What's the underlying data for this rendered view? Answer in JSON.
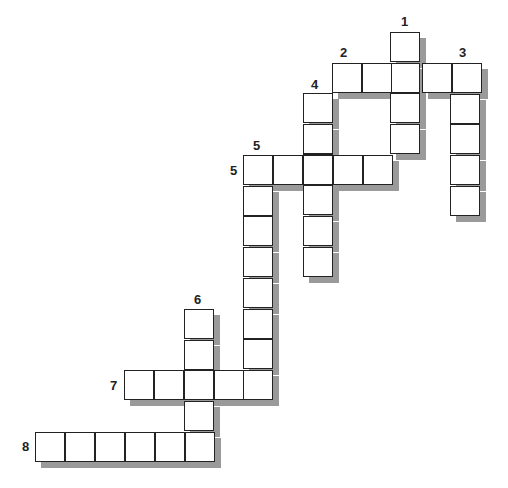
{
  "puzzle": {
    "type": "crossword",
    "cell_size": 30,
    "words": [
      {
        "number": "1",
        "direction": "down",
        "length": 4,
        "start_x": 390,
        "start_y": 32,
        "label_x": 401,
        "label_y": 15
      },
      {
        "number": "2",
        "direction": "across",
        "length": 5,
        "start_x": 332,
        "start_y": 63,
        "label_x": 340,
        "label_y": 46
      },
      {
        "number": "3",
        "direction": "down",
        "length": 5,
        "start_x": 450,
        "start_y": 63,
        "label_x": 459,
        "label_y": 46
      },
      {
        "number": "4",
        "direction": "down",
        "length": 6,
        "start_x": 303,
        "start_y": 93,
        "label_x": 311,
        "label_y": 78
      },
      {
        "number": "5",
        "direction": "across",
        "length": 5,
        "start_x": 243,
        "start_y": 155,
        "label_x": 230,
        "label_y": 164
      },
      {
        "number": "5",
        "direction": "down",
        "length": 8,
        "start_x": 243,
        "start_y": 155,
        "label_x": 253,
        "label_y": 139
      },
      {
        "number": "6",
        "direction": "down",
        "length": 5,
        "start_x": 184,
        "start_y": 309,
        "label_x": 194,
        "label_y": 293
      },
      {
        "number": "7",
        "direction": "across",
        "length": 5,
        "start_x": 124,
        "start_y": 370,
        "label_x": 110,
        "label_y": 379
      },
      {
        "number": "8",
        "direction": "across",
        "length": 6,
        "start_x": 35,
        "start_y": 432,
        "label_x": 22,
        "label_y": 440
      }
    ]
  }
}
